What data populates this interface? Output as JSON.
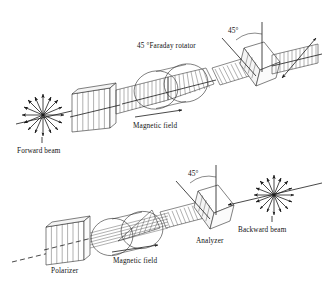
{
  "figure": {
    "background_color": "#ffffff",
    "line_color": "#1a1a1a",
    "width": 323,
    "height": 286
  },
  "panels": [
    {
      "id": "forward",
      "name": "forward-pass-panel",
      "labels": {
        "rotator": "45 °Faraday rotator",
        "angle": "45°",
        "magnetic_field": "Magnetic field",
        "beam": "Forward beam"
      },
      "components": [
        {
          "name": "unpolarized-starburst",
          "label": ""
        },
        {
          "name": "polarizer-block",
          "label": ""
        },
        {
          "name": "faraday-rotator-coil",
          "label": ""
        },
        {
          "name": "analyzer-prism",
          "label": ""
        }
      ]
    },
    {
      "id": "backward",
      "name": "backward-pass-panel",
      "labels": {
        "angle": "45°",
        "analyzer": "Analyzer",
        "magnetic_field": "Magnetic field",
        "polarizer": "Polarizer",
        "beam": "Backward beam"
      },
      "components": [
        {
          "name": "polarizer-block",
          "label": ""
        },
        {
          "name": "faraday-rotator-coil",
          "label": ""
        },
        {
          "name": "analyzer-prism",
          "label": ""
        },
        {
          "name": "unpolarized-starburst",
          "label": ""
        }
      ]
    }
  ]
}
